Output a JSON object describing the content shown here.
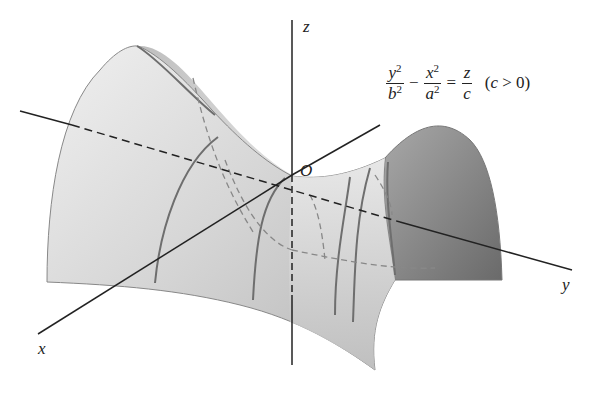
{
  "diagram": {
    "type": "hyperbolic-paraboloid",
    "axes": {
      "x_label": "x",
      "y_label": "y",
      "z_label": "z",
      "origin_label": "O"
    },
    "equation": {
      "term1_num": "y",
      "term1_num_exp": "2",
      "term1_den": "b",
      "term1_den_exp": "2",
      "minus": "−",
      "term2_num": "x",
      "term2_num_exp": "2",
      "term2_den": "a",
      "term2_den_exp": "2",
      "equals": "=",
      "rhs_num": "z",
      "rhs_den": "c",
      "condition_open": "(",
      "condition_var": "c",
      "condition_rest": " > 0)"
    },
    "colors": {
      "surface_light": "#e8e8e8",
      "surface_mid": "#c4c4c4",
      "surface_dark": "#8a8a8a",
      "line": "#222222",
      "trace": "#6e6e6e"
    }
  }
}
